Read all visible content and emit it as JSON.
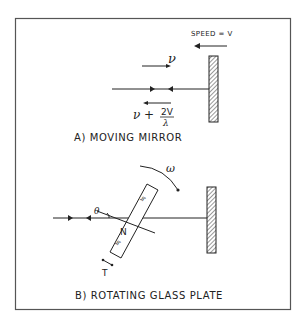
{
  "panel_a": {
    "caption": "A) MOVING MIRROR",
    "speed_label": "SPEED = V",
    "incident_freq": "ν",
    "reflected_freq_prefix": "ν +",
    "reflected_freq_num": "2V",
    "reflected_freq_den": "λ"
  },
  "panel_b": {
    "caption": "B) ROTATING GLASS PLATE",
    "omega_label": "ω",
    "theta_label": "θ",
    "normal_label": "N",
    "thickness_label": "T",
    "glass_mark": "≒"
  },
  "colors": {
    "line": "#222222",
    "frame": "#555555",
    "hatch": "#333333",
    "background": "#ffffff"
  }
}
